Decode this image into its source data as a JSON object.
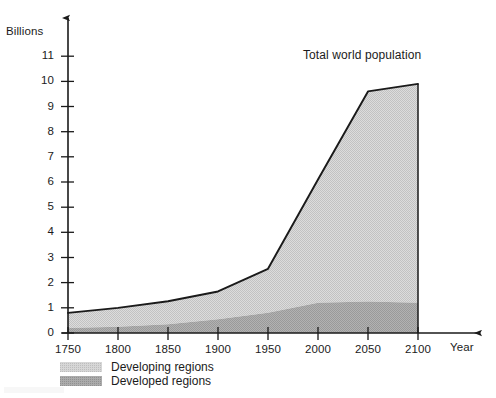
{
  "figure": {
    "y_axis_title": "Billions",
    "x_axis_title": "Year",
    "series_annotation": "Total world population"
  },
  "legend": {
    "position": "bottom-left",
    "items": [
      {
        "label": "Developing regions",
        "color": "#d6d6d6",
        "swatch": "developing-swatch"
      },
      {
        "label": "Developed regions",
        "color": "#ababab",
        "swatch": "developed-swatch"
      }
    ]
  },
  "axes": {
    "y_ticks": [
      "0",
      "1",
      "2",
      "3",
      "4",
      "5",
      "6",
      "7",
      "8",
      "9",
      "10",
      "11"
    ],
    "x_ticks": [
      "1750",
      "1800",
      "1850",
      "1900",
      "1950",
      "2000",
      "2050",
      "2100"
    ]
  },
  "chart_data": {
    "type": "area",
    "title": "",
    "subtitle": "",
    "xlabel": "Year",
    "ylabel": "Billions",
    "annotations": [
      {
        "text": "Total world population",
        "x": 2025,
        "y": 10.6
      }
    ],
    "grid": false,
    "legend_position": "bottom-left",
    "stacked": true,
    "x": [
      1750,
      1800,
      1850,
      1900,
      1950,
      2000,
      2050,
      2100
    ],
    "xlim": [
      1750,
      2100
    ],
    "ylim": [
      0,
      11.6
    ],
    "y_tick_values": [
      0,
      1,
      2,
      3,
      4,
      5,
      6,
      7,
      8,
      9,
      10,
      11
    ],
    "x_tick_values": [
      1750,
      1800,
      1850,
      1900,
      1950,
      2000,
      2050,
      2100
    ],
    "series": [
      {
        "name": "Developed regions",
        "color": "#ababab",
        "values": [
          0.2,
          0.25,
          0.35,
          0.55,
          0.8,
          1.2,
          1.25,
          1.2
        ]
      },
      {
        "name": "Developing regions",
        "color": "#d6d6d6",
        "values": [
          0.6,
          0.75,
          0.91,
          1.1,
          1.75,
          4.9,
          8.35,
          8.7
        ]
      }
    ],
    "total_line": {
      "name": "Total world population",
      "color": "#1a1a1a",
      "values": [
        0.8,
        1.0,
        1.26,
        1.65,
        2.55,
        6.1,
        9.6,
        9.9
      ]
    }
  }
}
